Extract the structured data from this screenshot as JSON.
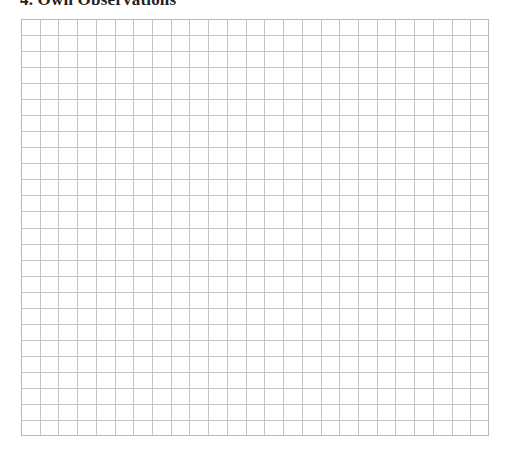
{
  "section": {
    "title": "4. Own Observations"
  },
  "grid": {
    "columns": 25,
    "rows": 26,
    "line_color": "#c4c4c4",
    "border_color": "#b8b8b8"
  }
}
